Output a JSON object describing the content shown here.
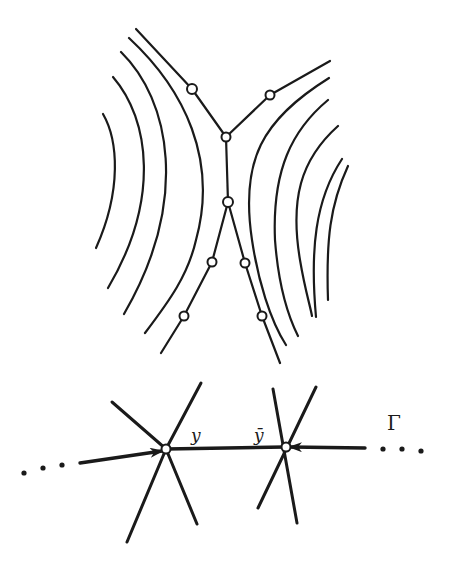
{
  "figure": {
    "top_panel": {
      "description": "Level curves (hyperbola-like family) with a branching path of marked nodes through the saddle region",
      "curves_left": 4,
      "curves_right": 5,
      "path_nodes": 9
    },
    "bottom_panel": {
      "labels": {
        "y": "y",
        "y_bar": "ȳ",
        "gamma": "Γ"
      },
      "left_ellipsis": "• • •",
      "right_ellipsis": "• • • •"
    },
    "colors": {
      "ink": "#1a1a1a",
      "background": "#ffffff"
    }
  }
}
